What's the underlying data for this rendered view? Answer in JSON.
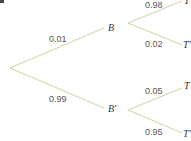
{
  "diagram": {
    "type": "probability-tree",
    "line_color": "#c9d4a0",
    "nodes": {
      "b": "B",
      "b_prime": "B'",
      "b_t": "T",
      "b_t_prime": "T'",
      "bp_t": "T",
      "bp_t_prime": "T'"
    },
    "edges": {
      "root_b": "0.01",
      "root_b_prime": "0.99",
      "b_t": "0.98",
      "b_t_prime": "0.02",
      "bp_t": "0.05",
      "bp_t_prime": "0.95"
    }
  }
}
